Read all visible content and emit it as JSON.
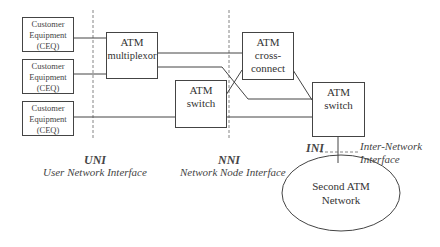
{
  "diagram": {
    "ceq_boxes": [
      {
        "lines": [
          "Customer",
          "Equipment",
          "(CEQ)"
        ]
      },
      {
        "lines": [
          "Customer",
          "Equipment",
          "(CEQ)"
        ]
      },
      {
        "lines": [
          "Customer",
          "Equipment",
          "(CEQ)"
        ]
      }
    ],
    "atm_multiplexor": {
      "lines": [
        "ATM",
        "multiplexor"
      ]
    },
    "atm_cross_connect": {
      "lines": [
        "ATM",
        "cross-",
        "connect"
      ]
    },
    "atm_switch_mid": {
      "lines": [
        "ATM",
        "switch"
      ]
    },
    "atm_switch_right": {
      "lines": [
        "ATM",
        "switch"
      ]
    },
    "second_network": {
      "lines": [
        "Second ATM",
        "Network"
      ]
    },
    "interfaces": {
      "uni": {
        "abbr": "UNI",
        "full": "User Network Interface"
      },
      "nni": {
        "abbr": "NNI",
        "full": "Network Node Interface"
      },
      "ini": {
        "abbr": "INI",
        "full_lines": [
          "Inter-Network",
          "Interface"
        ]
      }
    }
  }
}
